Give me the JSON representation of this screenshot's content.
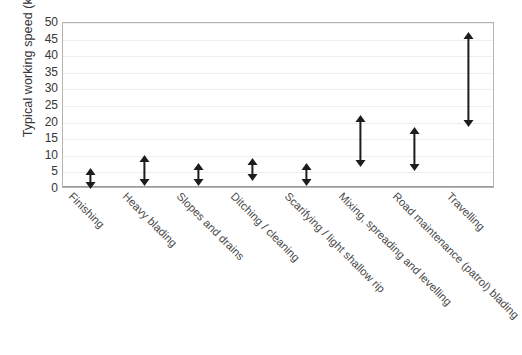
{
  "chart_data": {
    "type": "bar",
    "subtype": "range-arrow-plot",
    "title": "",
    "xlabel": "",
    "ylabel": "Typical working speed (km/h)",
    "ylim": [
      0,
      50
    ],
    "ytick_step": 5,
    "yticks": [
      50,
      45,
      40,
      35,
      30,
      25,
      20,
      15,
      10,
      5,
      0
    ],
    "grid": true,
    "legend": "none",
    "categories": [
      "Finishing",
      "Heavy blading",
      "Slopes and drains",
      "Ditching / cleaning",
      "Scarifying / light shallow rip",
      "Mixing, spreading and levelling",
      "Road maintenance (patrol) blading",
      "Travelling"
    ],
    "series": [
      {
        "name": "Minimum typical working speed",
        "values": [
          2.2,
          3.0,
          3.0,
          4.5,
          3.0,
          9.0,
          7.5,
          21.0
        ]
      },
      {
        "name": "Maximum typical working speed",
        "values": [
          4.0,
          8.0,
          5.5,
          7.0,
          5.5,
          20.0,
          16.5,
          45.0
        ]
      }
    ],
    "points": [
      {
        "category": "Finishing",
        "min": 2.2,
        "max": 4.0
      },
      {
        "category": "Heavy blading",
        "min": 3.0,
        "max": 8.0
      },
      {
        "category": "Slopes and drains",
        "min": 3.0,
        "max": 5.5
      },
      {
        "category": "Ditching / cleaning",
        "min": 4.5,
        "max": 7.0
      },
      {
        "category": "Scarifying / light shallow rip",
        "min": 3.0,
        "max": 5.5
      },
      {
        "category": "Mixing, spreading and levelling",
        "min": 9.0,
        "max": 20.0
      },
      {
        "category": "Road maintenance (patrol) blading",
        "min": 7.5,
        "max": 16.5
      },
      {
        "category": "Travelling",
        "min": 21.0,
        "max": 45.0
      }
    ],
    "colors": {
      "marker": "#1d1d1d",
      "gridline": "#eeeeee",
      "frame": "#b4b4b4",
      "text": "#363636",
      "background": "#ffffff"
    }
  }
}
